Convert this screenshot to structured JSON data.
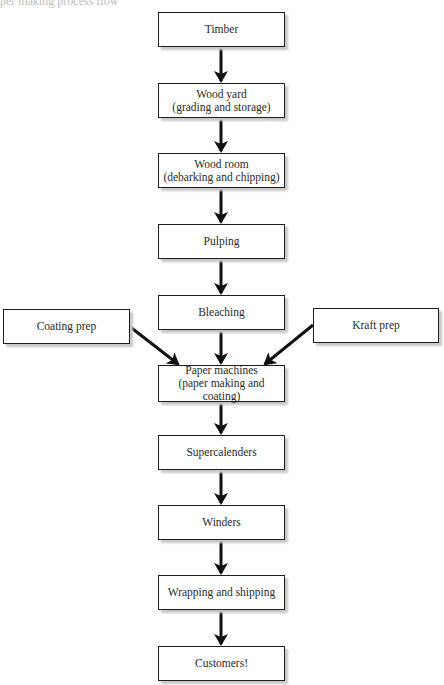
{
  "caption": "per making process flow",
  "diagram": {
    "type": "flowchart",
    "nodes": [
      {
        "id": "timber",
        "lines": [
          "Timber"
        ]
      },
      {
        "id": "wood-yard",
        "lines": [
          "Wood yard",
          "(grading and storage)"
        ]
      },
      {
        "id": "wood-room",
        "lines": [
          "Wood room",
          "(debarking and chipping)"
        ]
      },
      {
        "id": "pulping",
        "lines": [
          "Pulping"
        ]
      },
      {
        "id": "bleaching",
        "lines": [
          "Bleaching"
        ]
      },
      {
        "id": "coating-prep",
        "lines": [
          "Coating prep"
        ]
      },
      {
        "id": "kraft-prep",
        "lines": [
          "Kraft prep"
        ]
      },
      {
        "id": "paper-machines",
        "lines": [
          "Paper machines",
          "(paper making and coating)"
        ]
      },
      {
        "id": "supercalenders",
        "lines": [
          "Supercalenders"
        ]
      },
      {
        "id": "winders",
        "lines": [
          "Winders"
        ]
      },
      {
        "id": "wrapping",
        "lines": [
          "Wrapping and shipping"
        ]
      },
      {
        "id": "customers",
        "lines": [
          "Customers!"
        ]
      }
    ],
    "edges": [
      [
        "timber",
        "wood-yard"
      ],
      [
        "wood-yard",
        "wood-room"
      ],
      [
        "wood-room",
        "pulping"
      ],
      [
        "pulping",
        "bleaching"
      ],
      [
        "bleaching",
        "paper-machines"
      ],
      [
        "coating-prep",
        "paper-machines"
      ],
      [
        "kraft-prep",
        "paper-machines"
      ],
      [
        "paper-machines",
        "supercalenders"
      ],
      [
        "supercalenders",
        "winders"
      ],
      [
        "winders",
        "wrapping"
      ],
      [
        "wrapping",
        "customers"
      ]
    ]
  }
}
